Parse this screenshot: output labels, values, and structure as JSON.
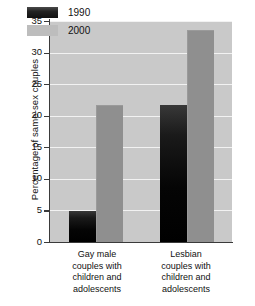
{
  "chart_data": {
    "type": "bar",
    "title": "",
    "subtitle": "",
    "xlabel": "",
    "ylabel": "Percentage of same-sex couples",
    "categories": [
      "Gay male couples with children and adolescents",
      "Lesbian couples with children and adolescents"
    ],
    "category_lines": [
      [
        "Gay male",
        "couples with",
        "children and",
        "adolescents"
      ],
      [
        "Lesbian",
        "couples with",
        "children and",
        "adolescents"
      ]
    ],
    "series": [
      {
        "name": "1990",
        "values": [
          4.9,
          21.7
        ],
        "color": "#111111"
      },
      {
        "name": "2000",
        "values": [
          21.7,
          33.6
        ],
        "color": "#8f8f8f"
      }
    ],
    "ylim": [
      0,
      35
    ],
    "yticks": [
      0,
      5,
      10,
      15,
      20,
      25,
      30,
      35
    ],
    "ytick_labels": [
      "0",
      "5",
      "10",
      "15",
      "20",
      "25",
      "30",
      "35"
    ],
    "grid": true,
    "legend_position": "upper-left-inside",
    "plot_background": "#c9c9c9",
    "gridline_color": "#f2f2f2"
  }
}
